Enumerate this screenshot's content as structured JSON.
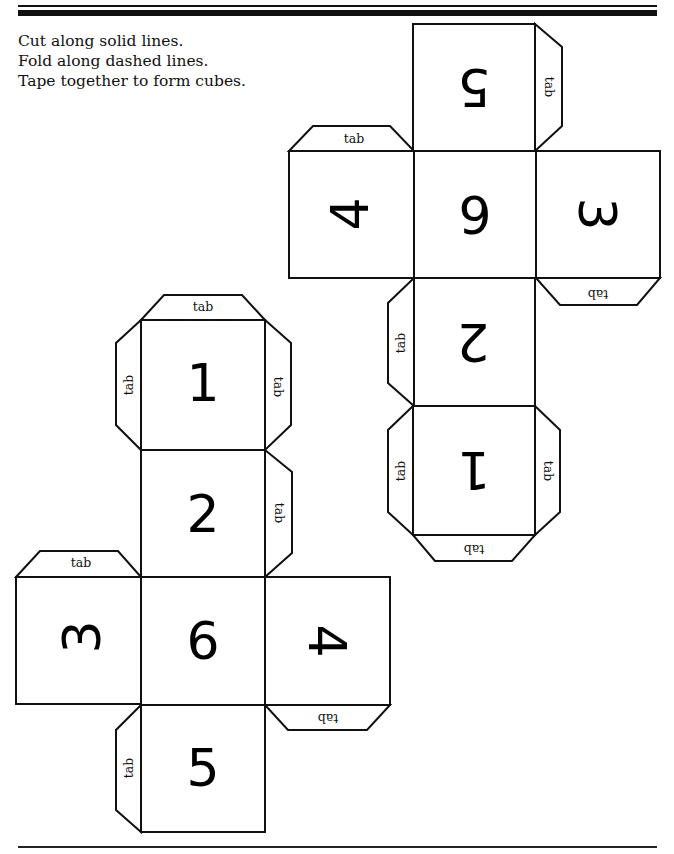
{
  "instructions": {
    "line1": "Cut along solid lines.",
    "line2": "Fold along dashed lines.",
    "line3": "Tape together to form cubes."
  },
  "tab_label": "tab",
  "net_a": {
    "description": "Top-right cube net (rotated 180°)",
    "faces": {
      "top": "5",
      "left": "4",
      "center": "6",
      "right": "3",
      "below_center": "2",
      "bottom": "1"
    },
    "tabs": {
      "top_right": "tab",
      "left_top": "tab",
      "right_bottom": "tab",
      "mid_left": "tab",
      "bottom_left": "tab",
      "bottom_right": "tab",
      "bottom_bottom": "tab"
    }
  },
  "net_b": {
    "description": "Bottom-left cube net",
    "faces": {
      "top": "1",
      "above_center": "2",
      "left": "3",
      "center": "6",
      "right": "4",
      "bottom": "5"
    },
    "tabs": {
      "top_top": "tab",
      "top_left": "tab",
      "top_right": "tab",
      "mid_right": "tab",
      "left_top": "tab",
      "right_bottom": "tab",
      "bottom_left": "tab"
    }
  },
  "colors": {
    "ink": "#111111",
    "paper": "#ffffff"
  }
}
